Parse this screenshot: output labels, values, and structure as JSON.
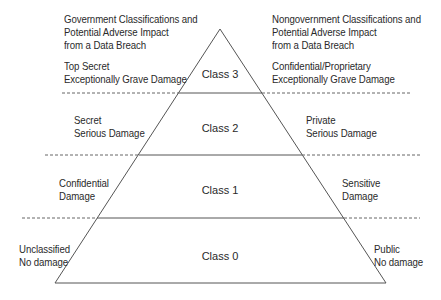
{
  "headers": {
    "left": [
      "Government Classifications and",
      "Potential Adverse Impact",
      "from a Data Breach"
    ],
    "right": [
      "Nongovernment Classifications and",
      "Potential Adverse Impact",
      "from a Data Breach"
    ]
  },
  "levels": [
    {
      "class_label": "Class 3",
      "left": [
        "Top Secret",
        "Exceptionally Grave Damage"
      ],
      "right": [
        "Confidential/Proprietary",
        "Exceptionally Grave Damage"
      ]
    },
    {
      "class_label": "Class 2",
      "left": [
        "Secret",
        "Serious Damage"
      ],
      "right": [
        "Private",
        "Serious Damage"
      ]
    },
    {
      "class_label": "Class 1",
      "left": [
        "Confidential",
        "Damage"
      ],
      "right": [
        "Sensitive",
        "Damage"
      ]
    },
    {
      "class_label": "Class 0",
      "left": [
        "Unclassified",
        "No damage"
      ],
      "right": [
        "Public",
        "No damage"
      ]
    }
  ],
  "colors": {
    "line": "#555555",
    "text": "#2a2a2a"
  }
}
